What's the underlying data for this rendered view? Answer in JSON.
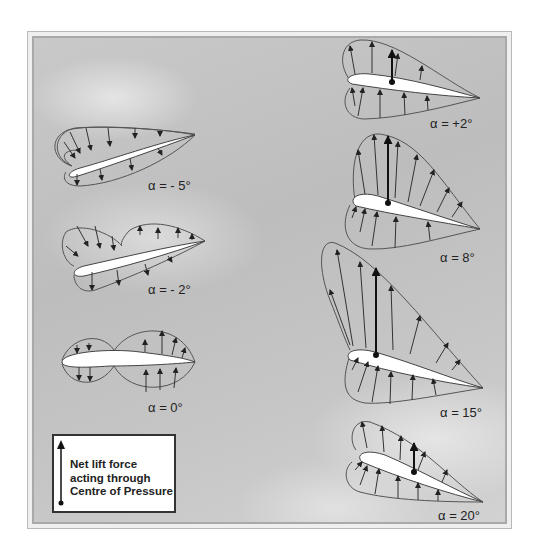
{
  "diagram": {
    "airfoils": [
      {
        "id": "a-5",
        "label": "α = - 5°",
        "alpha_deg": -5,
        "has_net_lift_arrow": false
      },
      {
        "id": "a-2",
        "label": "α = - 2°",
        "alpha_deg": -2,
        "has_net_lift_arrow": false
      },
      {
        "id": "a0",
        "label": "α =  0°",
        "alpha_deg": 0,
        "has_net_lift_arrow": false
      },
      {
        "id": "a2",
        "label": "α =  +2°",
        "alpha_deg": 2,
        "has_net_lift_arrow": true
      },
      {
        "id": "a8",
        "label": "α = 8°",
        "alpha_deg": 8,
        "has_net_lift_arrow": true
      },
      {
        "id": "a15",
        "label": "α = 15°",
        "alpha_deg": 15,
        "has_net_lift_arrow": true
      },
      {
        "id": "a20",
        "label": "α = 20°",
        "alpha_deg": 20,
        "has_net_lift_arrow": true
      }
    ],
    "legend": {
      "line1": "Net lift force",
      "line2": "acting through",
      "line3": "Centre of Pressure"
    },
    "colors": {
      "background": "#c4c4c4",
      "outline": "#555555",
      "airfoil_fill": "#ffffff",
      "arrow": "#222222"
    }
  }
}
